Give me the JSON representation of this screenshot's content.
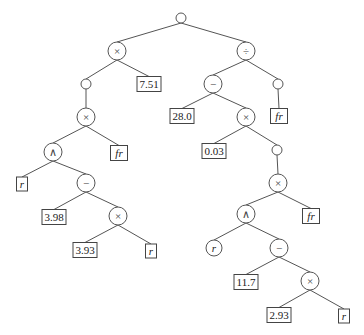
{
  "diagram": {
    "type": "expression-tree",
    "nodes": [
      {
        "id": "root",
        "kind": "circle",
        "label": "",
        "x": 181,
        "y": 18,
        "r": 5
      },
      {
        "id": "mul1",
        "kind": "circle",
        "label": "×",
        "x": 117,
        "y": 51,
        "r": 9
      },
      {
        "id": "div1",
        "kind": "circle",
        "label": "÷",
        "x": 246,
        "y": 51,
        "r": 9
      },
      {
        "id": "c1",
        "kind": "circle",
        "label": "",
        "x": 86,
        "y": 84,
        "r": 5
      },
      {
        "id": "v751",
        "kind": "box",
        "label": "7.51",
        "x": 149,
        "y": 84,
        "w": 24,
        "h": 15
      },
      {
        "id": "sub1",
        "kind": "circle",
        "label": "−",
        "x": 213,
        "y": 84,
        "r": 9
      },
      {
        "id": "c2",
        "kind": "circle",
        "label": "",
        "x": 278,
        "y": 84,
        "r": 5
      },
      {
        "id": "mul2",
        "kind": "circle",
        "label": "×",
        "x": 86,
        "y": 117,
        "r": 9
      },
      {
        "id": "v280",
        "kind": "box",
        "label": "28.0",
        "x": 182,
        "y": 116,
        "w": 24,
        "h": 15
      },
      {
        "id": "mul3",
        "kind": "circle",
        "label": "×",
        "x": 246,
        "y": 117,
        "r": 9
      },
      {
        "id": "fr1",
        "kind": "boxvar",
        "label": "fr",
        "x": 279,
        "y": 116,
        "w": 17,
        "h": 15
      },
      {
        "id": "pow1",
        "kind": "circle",
        "label": "∧",
        "x": 53,
        "y": 152,
        "r": 9
      },
      {
        "id": "fr2",
        "kind": "boxvar",
        "label": "fr",
        "x": 119,
        "y": 153,
        "w": 17,
        "h": 15
      },
      {
        "id": "v003",
        "kind": "box",
        "label": "0.03",
        "x": 214,
        "y": 151,
        "w": 24,
        "h": 15
      },
      {
        "id": "c3",
        "kind": "circle",
        "label": "",
        "x": 277,
        "y": 150,
        "r": 5
      },
      {
        "id": "r1",
        "kind": "boxvar",
        "label": "r",
        "x": 22,
        "y": 184,
        "w": 11,
        "h": 14
      },
      {
        "id": "sub2",
        "kind": "circle",
        "label": "−",
        "x": 86,
        "y": 183,
        "r": 9
      },
      {
        "id": "mul4",
        "kind": "circle",
        "label": "×",
        "x": 278,
        "y": 183,
        "r": 9
      },
      {
        "id": "v398",
        "kind": "box",
        "label": "3.98",
        "x": 54,
        "y": 217,
        "w": 24,
        "h": 15
      },
      {
        "id": "mul5",
        "kind": "circle",
        "label": "×",
        "x": 118,
        "y": 216,
        "r": 9
      },
      {
        "id": "pow2",
        "kind": "circle",
        "label": "∧",
        "x": 246,
        "y": 214,
        "r": 9
      },
      {
        "id": "fr3",
        "kind": "boxvar",
        "label": "fr",
        "x": 311,
        "y": 216,
        "w": 17,
        "h": 15
      },
      {
        "id": "v393",
        "kind": "box",
        "label": "3.93",
        "x": 85,
        "y": 250,
        "w": 24,
        "h": 15
      },
      {
        "id": "r2",
        "kind": "boxvar",
        "label": "r",
        "x": 151,
        "y": 251,
        "w": 11,
        "h": 14
      },
      {
        "id": "r3",
        "kind": "circlevar",
        "label": "r",
        "x": 214,
        "y": 248,
        "r": 8
      },
      {
        "id": "sub3",
        "kind": "circle",
        "label": "−",
        "x": 279,
        "y": 248,
        "r": 9
      },
      {
        "id": "v117",
        "kind": "box",
        "label": "11.7",
        "x": 246,
        "y": 282,
        "w": 24,
        "h": 15
      },
      {
        "id": "mul6",
        "kind": "circle",
        "label": "×",
        "x": 310,
        "y": 281,
        "r": 9
      },
      {
        "id": "v293",
        "kind": "box",
        "label": "2.93",
        "x": 279,
        "y": 315,
        "w": 24,
        "h": 15
      },
      {
        "id": "r4",
        "kind": "boxvar",
        "label": "r",
        "x": 344,
        "y": 316,
        "w": 11,
        "h": 14
      }
    ],
    "edges": [
      [
        "root",
        "mul1"
      ],
      [
        "root",
        "div1"
      ],
      [
        "mul1",
        "c1"
      ],
      [
        "mul1",
        "v751"
      ],
      [
        "div1",
        "sub1"
      ],
      [
        "div1",
        "c2"
      ],
      [
        "c1",
        "mul2"
      ],
      [
        "sub1",
        "v280"
      ],
      [
        "sub1",
        "mul3"
      ],
      [
        "c2",
        "fr1"
      ],
      [
        "mul2",
        "pow1"
      ],
      [
        "mul2",
        "fr2"
      ],
      [
        "mul3",
        "v003"
      ],
      [
        "mul3",
        "c3"
      ],
      [
        "pow1",
        "r1"
      ],
      [
        "pow1",
        "sub2"
      ],
      [
        "c3",
        "mul4"
      ],
      [
        "sub2",
        "v398"
      ],
      [
        "sub2",
        "mul5"
      ],
      [
        "mul4",
        "pow2"
      ],
      [
        "mul4",
        "fr3"
      ],
      [
        "mul5",
        "v393"
      ],
      [
        "mul5",
        "r2"
      ],
      [
        "pow2",
        "r3"
      ],
      [
        "pow2",
        "sub3"
      ],
      [
        "sub3",
        "v117"
      ],
      [
        "sub3",
        "mul6"
      ],
      [
        "mul6",
        "v293"
      ],
      [
        "mul6",
        "r4"
      ]
    ]
  }
}
